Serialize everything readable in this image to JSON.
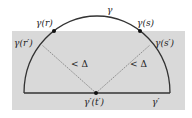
{
  "diagram": {
    "colors": {
      "background": "#ffffff",
      "shaded_region": "#d9d9d9",
      "curve": "#333333",
      "dashed": "#777777",
      "point": "#111111"
    },
    "labels": {
      "gamma": "γ",
      "gamma_r": "γ(r)",
      "gamma_s": "γ(s)",
      "gamma_r_prime": "γ(r′)",
      "gamma_s_prime": "γ(s′)",
      "gamma_prime_t_prime": "γ′(t′)",
      "gamma_prime": "γ′",
      "less_delta_left": "< Δ",
      "less_delta_right": "< Δ"
    }
  }
}
